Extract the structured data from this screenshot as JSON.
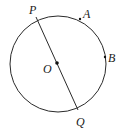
{
  "diagram": {
    "center": {
      "label": "O"
    },
    "diameter": {
      "endpoints": [
        "P",
        "Q"
      ]
    },
    "points_on_circle": [
      {
        "label": "P"
      },
      {
        "label": "A"
      },
      {
        "label": "B"
      },
      {
        "label": "Q"
      }
    ],
    "stroke_color": "#2a2a2a"
  }
}
